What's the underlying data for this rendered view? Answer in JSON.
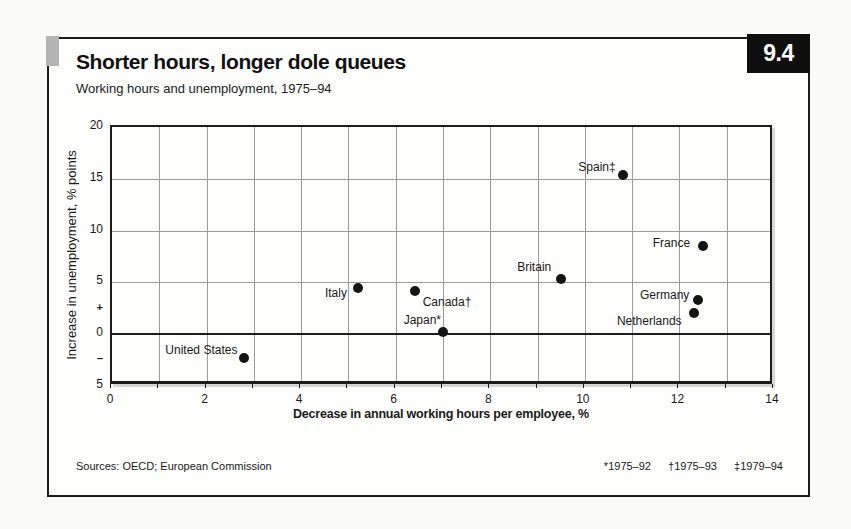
{
  "header": {
    "figure_number": "9.4",
    "title": "Shorter hours, longer dole queues",
    "subtitle": "Working hours and unemployment, 1975–94"
  },
  "chart_data": {
    "type": "scatter",
    "title": "Shorter hours, longer dole queues",
    "subtitle": "Working hours and unemployment, 1975–94",
    "xlabel": "Decrease in annual working hours per employee, %",
    "ylabel": "Increase in unemployment, % points",
    "xlim": [
      0,
      14
    ],
    "ylim": [
      -5,
      20
    ],
    "grid": true,
    "x_grid_interval": 1,
    "y_gridlines": [
      15,
      10,
      5
    ],
    "zero_line": 0,
    "x_ticks": [
      0,
      2,
      4,
      6,
      8,
      10,
      12,
      14
    ],
    "x_minor_tick_interval": 1,
    "y_ticks": [
      {
        "label": "20",
        "value": 20
      },
      {
        "label": "15",
        "value": 15
      },
      {
        "label": "10",
        "value": 10
      },
      {
        "label": "5",
        "value": 5
      },
      {
        "label": "+",
        "value": 2.4
      },
      {
        "label": "0",
        "value": 0
      },
      {
        "label": "–",
        "value": -2.5
      },
      {
        "label": "5",
        "value": -5
      }
    ],
    "points": [
      {
        "name": "united-states",
        "label": "United States",
        "x": 2.8,
        "y": -2.3,
        "anchor": "end",
        "dx": -3,
        "dy": -8
      },
      {
        "name": "italy",
        "label": "Italy",
        "x": 5.2,
        "y": 4.5,
        "anchor": "end",
        "dx": -7,
        "dy": 5
      },
      {
        "name": "canada",
        "label": "Canada†",
        "x": 6.4,
        "y": 4.2,
        "anchor": "start",
        "dx": 8,
        "dy": 11
      },
      {
        "name": "japan",
        "label": "Japan*",
        "x": 7.0,
        "y": 0.2,
        "anchor": "end",
        "dx": 2,
        "dy": -12
      },
      {
        "name": "britain",
        "label": "Britain",
        "x": 9.5,
        "y": 5.3,
        "anchor": "end",
        "dx": -6,
        "dy": -12
      },
      {
        "name": "spain",
        "label": "Spain‡",
        "x": 10.8,
        "y": 15.4,
        "anchor": "end",
        "dx": -3,
        "dy": -8
      },
      {
        "name": "france",
        "label": "France",
        "x": 12.5,
        "y": 8.5,
        "anchor": "end",
        "dx": -9,
        "dy": -3
      },
      {
        "name": "germany",
        "label": "Germany",
        "x": 12.4,
        "y": 3.3,
        "anchor": "end",
        "dx": -5,
        "dy": -5
      },
      {
        "name": "netherlands",
        "label": "Netherlands",
        "x": 12.3,
        "y": 2.0,
        "anchor": "end",
        "dx": -8,
        "dy": 8
      }
    ]
  },
  "footer": {
    "sources": "Sources: OECD; European Commission",
    "footnotes": [
      "*1975–92",
      "†1975–93",
      "‡1979–94"
    ]
  },
  "colors": {
    "text": "#1a1a1a",
    "grid": "#9b9b9b",
    "dot": "#141414",
    "badge_bg": "#0f0f0f",
    "badge_text": "#ffffff",
    "tab_gray": "#b4b4b4",
    "card_bg": "#fefefd",
    "page_bg": "#fafaf8"
  }
}
